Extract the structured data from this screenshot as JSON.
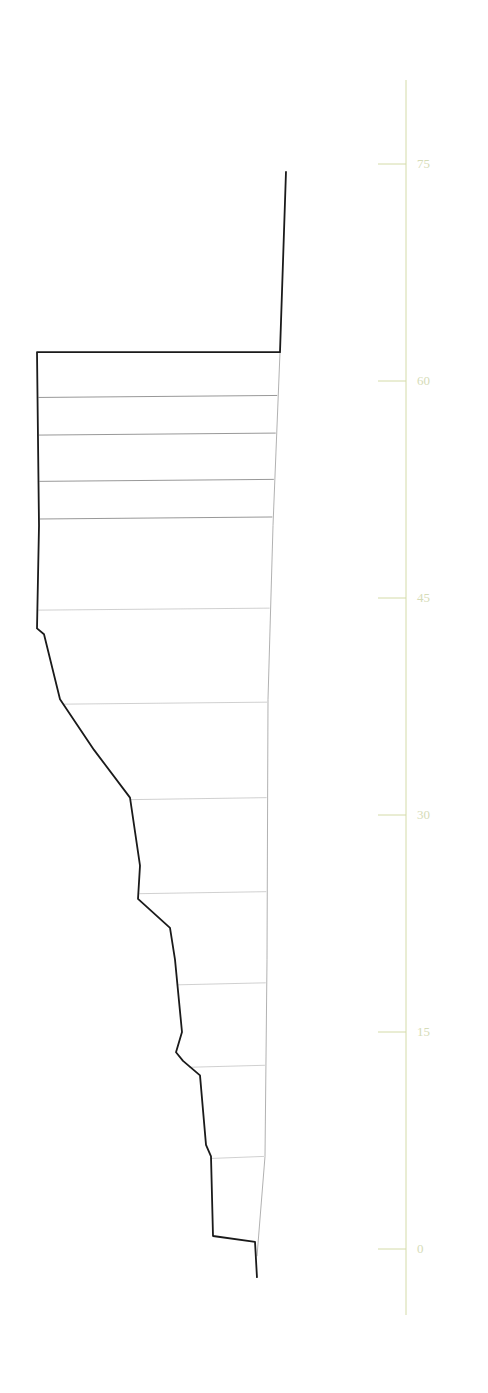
{
  "chart_data": {
    "type": "line",
    "title": "",
    "xlabel": "",
    "ylabel": "",
    "y_axis": {
      "ticks": [
        0,
        15,
        30,
        45,
        60,
        75
      ],
      "tick_labels": [
        "0",
        "15",
        "30",
        "45",
        "60",
        "75"
      ],
      "ylim": [
        -3.5,
        81
      ],
      "color": "#d4dba8",
      "position": "right"
    },
    "grid": false,
    "legend": null,
    "layer_boundaries": [
      62.0,
      59.0,
      56.4,
      53.2,
      50.6,
      44.3,
      37.8,
      31.2,
      24.7,
      18.4,
      12.7,
      6.4,
      0.9
    ],
    "profile_outline": [
      {
        "x_px": 257,
        "y": -2.0
      },
      {
        "x_px": 255,
        "y": 0.5
      },
      {
        "x_px": 213,
        "y": 0.9
      },
      {
        "x_px": 211,
        "y": 6.4
      },
      {
        "x_px": 206,
        "y": 7.2
      },
      {
        "x_px": 200,
        "y": 12.0
      },
      {
        "x_px": 183,
        "y": 13.0
      },
      {
        "x_px": 176,
        "y": 13.6
      },
      {
        "x_px": 182,
        "y": 15.0
      },
      {
        "x_px": 175,
        "y": 20.0
      },
      {
        "x_px": 170,
        "y": 22.2
      },
      {
        "x_px": 138,
        "y": 24.2
      },
      {
        "x_px": 140,
        "y": 26.5
      },
      {
        "x_px": 130,
        "y": 31.2
      },
      {
        "x_px": 94,
        "y": 34.5
      },
      {
        "x_px": 60,
        "y": 38.0
      },
      {
        "x_px": 44,
        "y": 42.5
      },
      {
        "x_px": 37,
        "y": 42.9
      },
      {
        "x_px": 39,
        "y": 50.0
      },
      {
        "x_px": 37,
        "y": 62.0
      },
      {
        "x_px": 280,
        "y": 62.0
      },
      {
        "x_px": 286,
        "y": 74.5
      }
    ],
    "right_boundary": [
      {
        "x_px": 280,
        "y": 62.0
      },
      {
        "x_px": 273,
        "y": 50.0
      },
      {
        "x_px": 268,
        "y": 38.0
      },
      {
        "x_px": 267,
        "y": 20.0
      },
      {
        "x_px": 265,
        "y": 6.4
      },
      {
        "x_px": 257,
        "y": -0.5
      }
    ],
    "colors": {
      "outline": "#1a1a1a",
      "layer_lines": "#9a9a9a",
      "axis": "#d4dba8",
      "axis_labels": "#d6dcb8"
    }
  }
}
